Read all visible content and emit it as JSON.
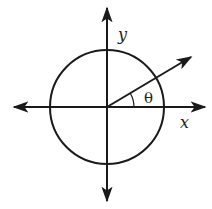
{
  "diagram": {
    "type": "unit-circle-angle",
    "labels": {
      "x_axis": "x",
      "y_axis": "y",
      "angle": "θ"
    },
    "geometry": {
      "center": [
        107,
        107
      ],
      "radius": 57,
      "angle_degrees": 30,
      "arc_radius": 28
    },
    "colors": {
      "stroke": "#1a1a1a",
      "background": "#ffffff"
    }
  }
}
